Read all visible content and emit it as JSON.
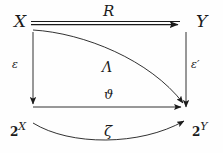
{
  "diagram": {
    "type": "commutative-diagram",
    "background_color": "#fefefe",
    "stroke_color": "#1b1b1b",
    "nodes": [
      {
        "id": "X",
        "label": "X",
        "position": "top-left",
        "x": 14,
        "y": 13
      },
      {
        "id": "Y",
        "label": "Y",
        "position": "top-right",
        "x": 196,
        "y": 13
      },
      {
        "id": "2X",
        "base": "2",
        "exponent": "X",
        "label": "2X",
        "position": "bottom-left",
        "x": 10,
        "y": 121
      },
      {
        "id": "2Y",
        "base": "2",
        "exponent": "Y",
        "label": "2Y",
        "position": "bottom-right",
        "x": 192,
        "y": 121
      }
    ],
    "edges": [
      {
        "id": "R",
        "label": "R",
        "from": "X",
        "to": "Y",
        "style": "double-line-arrow",
        "shape": "straight-horizontal"
      },
      {
        "id": "eps",
        "label": "ε",
        "from": "X",
        "to": "2X",
        "style": "single-arrow",
        "shape": "straight-vertical"
      },
      {
        "id": "epsp",
        "label": "ε′",
        "from": "Y",
        "to": "2Y",
        "style": "single-arrow",
        "shape": "straight-vertical"
      },
      {
        "id": "lambda",
        "label": "Λ",
        "from": "X",
        "to": "2Y",
        "style": "single-arrow",
        "shape": "curve-convex-up"
      },
      {
        "id": "theta",
        "label": "ϑ",
        "from": "2X",
        "to": "2Y",
        "style": "single-arrow",
        "shape": "straight-horizontal"
      },
      {
        "id": "zeta",
        "label": "ζ",
        "from": "2X",
        "to": "2Y",
        "style": "single-arrow",
        "shape": "curve-concave-down"
      }
    ]
  }
}
